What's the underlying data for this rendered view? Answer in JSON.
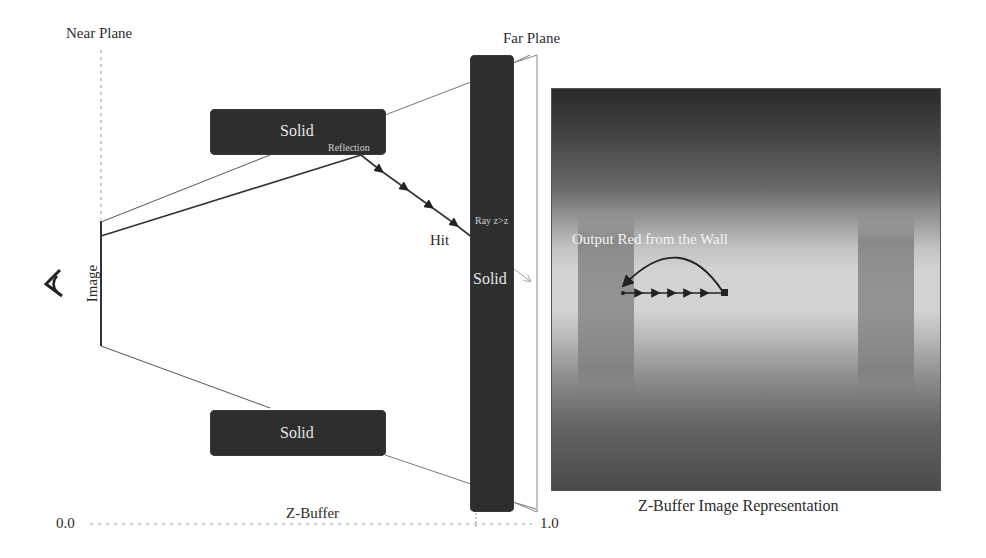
{
  "diagram": {
    "labels": {
      "near_plane": "Near Plane",
      "far_plane": "Far Plane",
      "image": "Image",
      "hit": "Hit",
      "z_buffer": "Z-Buffer",
      "axis_start": "0.0",
      "axis_end": "1.0",
      "z_buffer_image_caption": "Z-Buffer Image Representation"
    },
    "solids": [
      {
        "label": "Solid",
        "sublabel": "Reflection"
      },
      {
        "label": "Solid"
      },
      {
        "label": "Solid",
        "sublabel": "Ray z>z"
      }
    ],
    "z_image": {
      "annotation": "Output Red from the Wall"
    },
    "icons": {
      "eye": "eye-icon"
    }
  }
}
